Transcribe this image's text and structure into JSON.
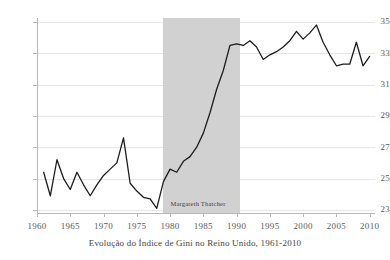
{
  "caption": "Evolução do Índice de Gini no Reino Unido, 1961-2010",
  "annotation": {
    "label": "Margareth Thatcher",
    "start_year": 1979,
    "end_year": 1990.5,
    "color": "#cfcfcf"
  },
  "chart_data": {
    "type": "line",
    "title": "Evolução do Índice de Gini no Reino Unido, 1961-2010",
    "xlabel": "",
    "ylabel": "",
    "xlim": [
      1960,
      2010.8
    ],
    "ylim": [
      22.8,
      35.25
    ],
    "grid": true,
    "grid_axis": "y",
    "legend": "none",
    "line_color": "#1c1c1c",
    "line_width": 1.3,
    "xticks": [
      1960,
      1965,
      1970,
      1975,
      1980,
      1985,
      1990,
      1995,
      2000,
      2005,
      2010
    ],
    "xtick_labels": [
      "1960",
      "1965",
      "1970",
      "1975",
      "1980",
      "1985",
      "1990",
      "1995",
      "2000",
      "2005",
      "2010"
    ],
    "yticks": [
      23,
      25,
      27,
      29,
      31,
      33,
      35
    ],
    "ytick_labels": [
      "23",
      "25",
      "27",
      "29",
      "31",
      "33",
      "35"
    ],
    "series": [
      {
        "name": "Índice de Gini — Reino Unido",
        "x": [
          1961,
          1962,
          1963,
          1964,
          1965,
          1966,
          1967,
          1968,
          1969,
          1970,
          1971,
          1972,
          1973,
          1974,
          1975,
          1976,
          1977,
          1978,
          1979,
          1980,
          1981,
          1982,
          1983,
          1984,
          1985,
          1986,
          1987,
          1988,
          1989,
          1990,
          1991,
          1992,
          1993,
          1994,
          1995,
          1996,
          1997,
          1998,
          1999,
          2000,
          2001,
          2002,
          2003,
          2004,
          2005,
          2006,
          2007,
          2008,
          2009,
          2010
        ],
        "values": [
          25.4,
          23.9,
          26.2,
          25.0,
          24.3,
          25.4,
          24.6,
          23.9,
          24.6,
          25.2,
          25.6,
          26.0,
          27.6,
          24.7,
          24.2,
          23.8,
          23.7,
          23.1,
          24.8,
          25.6,
          25.4,
          26.1,
          26.4,
          27.0,
          27.9,
          29.2,
          30.7,
          31.9,
          33.5,
          33.6,
          33.5,
          33.8,
          33.4,
          32.6,
          32.9,
          33.1,
          33.4,
          33.8,
          34.4,
          33.9,
          34.3,
          34.8,
          33.7,
          32.9,
          32.2,
          32.3,
          32.3,
          33.7,
          32.2,
          32.8
        ]
      }
    ]
  }
}
